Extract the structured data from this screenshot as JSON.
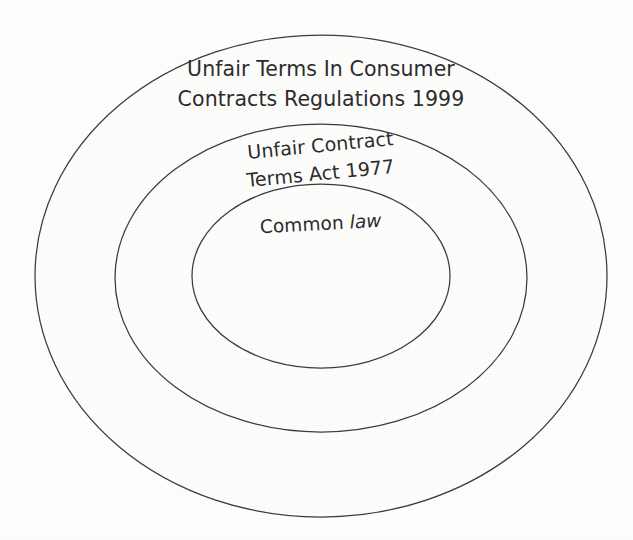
{
  "diagram": {
    "type": "nested-ellipse-hierarchy",
    "title": "",
    "background_color": "#fefefe",
    "stroke_color": "#3a3a38",
    "fill_color": "#fdfdfc",
    "text_color": "#2b2b2b",
    "rings": [
      {
        "id": "outer",
        "level": 1,
        "name": "outer-ring",
        "label_lines": [
          "Unfair Terms In Consumer",
          "Contracts Regulations 1999"
        ],
        "label_full": "Unfair Terms In Consumer Contracts Regulations 1999",
        "center_x": 321,
        "center_y": 276,
        "radius_x": 286,
        "radius_y": 241,
        "rotation_deg": 0,
        "label_x": 321,
        "label_line1_y": 76,
        "label_line2_y": 106
      },
      {
        "id": "middle",
        "level": 2,
        "name": "middle-ring",
        "label_lines": [
          "Unfair Contract",
          "Terms Act 1977"
        ],
        "label_full": "Unfair Contract Terms Act 1977",
        "center_x": 321,
        "center_y": 278,
        "radius_x": 206,
        "radius_y": 154,
        "rotation_deg": -5.5,
        "label_x": 321,
        "label_line1_y": 152,
        "label_line2_y": 180
      },
      {
        "id": "inner",
        "level": 3,
        "name": "inner-circle",
        "label_lines": [
          "Common law"
        ],
        "label_full": "Common law",
        "label_word_regular": "Common ",
        "label_word_italic": "law",
        "center_x": 321,
        "center_y": 276,
        "radius_x": 129,
        "radius_y": 92,
        "rotation_deg": -3,
        "label_x": 321,
        "label_line1_y": 230
      }
    ]
  }
}
